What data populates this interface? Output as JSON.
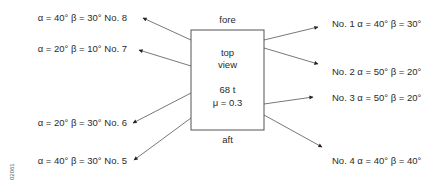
{
  "diagram": {
    "box": {
      "labels": {
        "top": "fore",
        "bottom": "aft"
      },
      "inner": [
        "top",
        "view",
        "68 t",
        "μ = 0.3"
      ]
    },
    "left_labels": [
      {
        "id": "no8",
        "text": "α = 40° β = 30° No. 8"
      },
      {
        "id": "no7",
        "text": "α = 20° β = 10° No. 7"
      },
      {
        "id": "no6",
        "text": "α = 20° β = 30° No. 6"
      },
      {
        "id": "no5",
        "text": "α = 40° β = 30° No. 5"
      }
    ],
    "right_labels": [
      {
        "id": "no1",
        "text": "No. 1 α = 40° β = 30°"
      },
      {
        "id": "no2",
        "text": "No. 2 α = 50° β = 20°"
      },
      {
        "id": "no3",
        "text": "No. 3 α = 50° β = 20°"
      },
      {
        "id": "no4",
        "text": "No. 4 α = 40° β = 40°"
      }
    ],
    "figure_id": "02061",
    "colors": {
      "line": "#555555",
      "text": "#2a2a2a"
    }
  }
}
